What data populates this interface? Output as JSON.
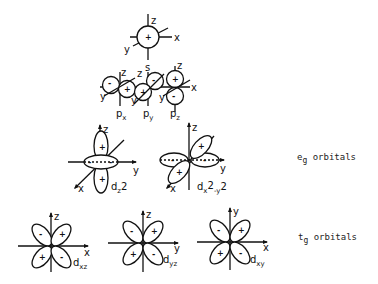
{
  "diagram": {
    "type": "atomic-orbitals",
    "s_orbital": {
      "label": "s",
      "sign": "+",
      "axes": [
        "x",
        "y",
        "z"
      ]
    },
    "p_orbitals": [
      {
        "label": "p",
        "subscript": "x",
        "signs": [
          "-",
          "+"
        ]
      },
      {
        "label": "p",
        "subscript": "y",
        "signs": [
          "-",
          "+"
        ]
      },
      {
        "label": "p",
        "subscript": "z",
        "signs": [
          "+",
          "-"
        ]
      }
    ],
    "eg_orbitals": {
      "group_label": "e",
      "group_subscript": "g",
      "group_suffix": " orbitals",
      "items": [
        {
          "label": "d",
          "subscript": "z2",
          "display": "dz2",
          "signs": [
            "+",
            "+",
            "-",
            "-"
          ],
          "axes": [
            "x",
            "y",
            "z"
          ]
        },
        {
          "label": "d",
          "subscript": "x2-y2",
          "display": "dx2-y2",
          "signs": [
            "+",
            "+",
            "-",
            "-"
          ],
          "axes": [
            "x",
            "y",
            "z"
          ]
        }
      ]
    },
    "t2g_orbitals": {
      "group_label": "t",
      "group_subscript": "g",
      "group_suffix": " orbitals",
      "items": [
        {
          "label": "d",
          "subscript": "xz",
          "signs": [
            "-",
            "+",
            "+",
            "-"
          ],
          "axes": [
            "x",
            "z"
          ]
        },
        {
          "label": "d",
          "subscript": "yz",
          "signs": [
            "-",
            "+",
            "+",
            "-"
          ],
          "axes": [
            "y",
            "z"
          ]
        },
        {
          "label": "d",
          "subscript": "xy",
          "signs": [
            "-",
            "+",
            "+",
            "-"
          ],
          "axes": [
            "x",
            "y"
          ]
        }
      ]
    }
  },
  "labels": {
    "s": "s",
    "px": "p",
    "px_sub": "x",
    "py": "p",
    "py_sub": "y",
    "pz": "p",
    "pz_sub": "z",
    "dz2": "d",
    "dz2_sub": "z",
    "dz2_sup": "2",
    "dx2y2": "d",
    "dx2y2_sub": "x",
    "dx2y2_sup": "2",
    "dx2y2_tail": "-y",
    "dx2y2_sup2": "2",
    "dxz": "d",
    "dxz_sub": "xz",
    "dyz": "d",
    "dyz_sub": "yz",
    "dxy": "d",
    "dxy_sub": "xy",
    "eg_main": "e",
    "eg_sub": "g",
    "eg_suffix": " orbitals",
    "tg_main": "t",
    "tg_sub": "g",
    "tg_suffix": " orbitals",
    "axis_x": "x",
    "axis_y": "y",
    "axis_z": "z",
    "plus": "+",
    "minus": "-"
  }
}
